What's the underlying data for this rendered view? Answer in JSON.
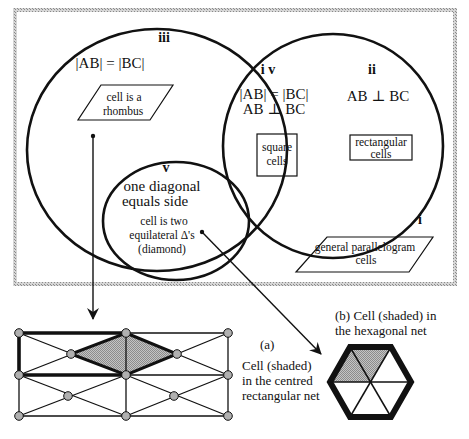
{
  "diagram": {
    "regions": {
      "i": {
        "label": "i",
        "cell_text_1": "general parallelogram",
        "cell_text_2": "cells"
      },
      "ii": {
        "label": "ii",
        "condition": "AB ⊥ BC",
        "cell_text_1": "rectangular",
        "cell_text_2": "cells"
      },
      "iii": {
        "label": "iii",
        "condition": "|AB| = |BC|",
        "cell_text_1": "cell is a",
        "cell_text_2": "rhombus"
      },
      "iv": {
        "label": "i v",
        "condition_1": "|AB| = |BC|",
        "condition_2": "AB ⊥ BC",
        "cell_text_1": "square",
        "cell_text_2": "cells"
      },
      "v": {
        "label": "v",
        "condition_1": "one diagonal",
        "condition_2": "equals side",
        "note_1": "cell is two",
        "note_2": "equilateral  Δ's",
        "note_3": "(diamond)"
      }
    },
    "panel_a": {
      "tag": "(a)",
      "caption_1": "Cell (shaded)",
      "caption_2": "in the centred",
      "caption_3": "rectangular net"
    },
    "panel_b": {
      "caption_1": "(b) Cell (shaded) in",
      "caption_2": "the hexagonal net"
    },
    "colors": {
      "line": "#111111",
      "shade": "#b5b5b5",
      "node_fill": "#b0b0b0",
      "frame": "#a8a8a8",
      "background": "#ffffff"
    }
  }
}
